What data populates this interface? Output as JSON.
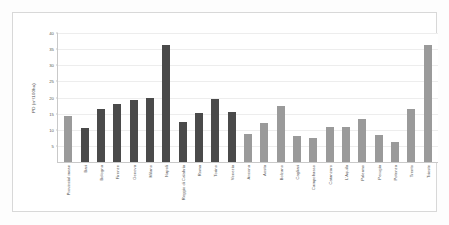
{
  "chart_data": {
    "type": "bar",
    "title": "",
    "xlabel": "",
    "ylabel": "PD (n°/100ha)",
    "ylim": [
      0,
      40
    ],
    "yticks": [
      0,
      5,
      10,
      15,
      20,
      25,
      30,
      35,
      40
    ],
    "grid": true,
    "legend": "none",
    "categories": [
      "Provincial mean",
      "Bari",
      "Bologna",
      "Firenze",
      "Genova",
      "Milano",
      "Napoli",
      "Reggio di Calabria",
      "Roma",
      "Torino",
      "Venezia",
      "Ancona",
      "Aosta",
      "Bolzano",
      "Cagliari",
      "Campobasso",
      "Catanzaro",
      "L'Aquila",
      "Palermo",
      "Perugia",
      "Potenza",
      "Trento",
      "Trieste"
    ],
    "values": [
      14.2,
      10.7,
      16.3,
      18.1,
      19.2,
      20.0,
      36.3,
      12.4,
      15.2,
      19.4,
      15.6,
      8.8,
      12.0,
      17.3,
      8.0,
      7.4,
      11.0,
      11.0,
      13.2,
      8.5,
      6.2,
      16.3,
      36.3
    ],
    "bar_styles": [
      "light",
      "dark",
      "dark",
      "dark",
      "dark",
      "dark",
      "dark",
      "dark",
      "dark",
      "dark",
      "dark",
      "light",
      "light",
      "light",
      "light",
      "light",
      "light",
      "light",
      "light",
      "light",
      "light",
      "light",
      "light"
    ],
    "colors": {
      "dark_bar": "#4a4a4a",
      "light_bar": "#9a9a9a",
      "gridline": "#ededed",
      "axis": "#c9c9c9",
      "text": "#525252",
      "background": "#ffffff"
    }
  }
}
